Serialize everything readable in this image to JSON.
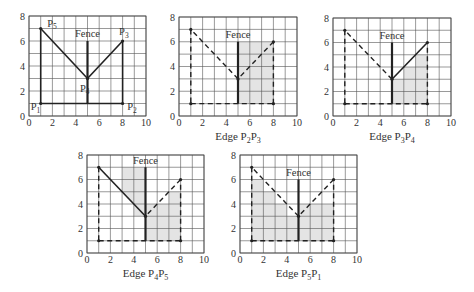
{
  "figure": {
    "fence_label": "Fence",
    "axis": {
      "x_ticks": [
        0,
        2,
        4,
        6,
        8,
        10
      ],
      "y_ticks": [
        0,
        2,
        4,
        6,
        8
      ],
      "xlim": [
        0,
        10
      ],
      "ylim": [
        0,
        8
      ]
    },
    "points": {
      "P1": [
        1,
        1
      ],
      "P2": [
        8,
        1
      ],
      "P3": [
        8,
        6
      ],
      "P4": [
        5,
        3
      ],
      "P5": [
        1,
        7
      ]
    },
    "fence": {
      "x": 5,
      "y_from": 1,
      "y_to": 6
    },
    "colors": {
      "line": "#222222",
      "grid": "#555555",
      "shade": "#e4e4e4"
    }
  },
  "panels": [
    {
      "id": "polygon",
      "caption": "",
      "caption_parts": [],
      "frame": {
        "x": 29,
        "y": 16,
        "w": 117,
        "h": 100
      },
      "show_point_labels": true,
      "point_labels": [
        {
          "name": "P",
          "sub": "1",
          "x": 0.15,
          "y": 0.45
        },
        {
          "name": "P",
          "sub": "2",
          "x": 8.4,
          "y": 0.45
        },
        {
          "name": "P",
          "sub": "3",
          "x": 7.7,
          "y": 6.45
        },
        {
          "name": "P",
          "sub": "4",
          "x": 4.35,
          "y": 1.95
        },
        {
          "name": "P",
          "sub": "5",
          "x": 1.55,
          "y": 7.15
        }
      ],
      "fence_top": 6,
      "fence_label_pos": [
        5,
        6.3
      ],
      "solid_edges": [
        [
          "P1",
          "P2"
        ],
        [
          "P2",
          "P3"
        ],
        [
          "P3",
          "P4"
        ],
        [
          "P4",
          "P5"
        ],
        [
          "P5",
          "P1"
        ]
      ],
      "dashed_edges": [],
      "shade": []
    },
    {
      "id": "edge-p2p3",
      "caption": "Edge P2P3",
      "caption_parts": [
        "Edge P",
        "2",
        "P",
        "3"
      ],
      "frame": {
        "x": 179,
        "y": 17,
        "w": 118,
        "h": 99
      },
      "show_point_labels": false,
      "point_labels": [],
      "fence_top": 6,
      "fence_label_pos": [
        5,
        6.3
      ],
      "solid_edges": [],
      "dashed_edges": [
        [
          "P1",
          "P2"
        ],
        [
          "P2",
          "P3"
        ],
        [
          "P3",
          "P4"
        ],
        [
          "P4",
          "P5"
        ],
        [
          "P5",
          "P1"
        ]
      ],
      "shade": [
        [
          [
            5,
            1
          ],
          [
            8,
            1
          ],
          [
            8,
            6
          ],
          [
            5,
            6
          ]
        ]
      ]
    },
    {
      "id": "edge-p3p4",
      "caption": "Edge P3P4",
      "caption_parts": [
        "Edge P",
        "3",
        "P",
        "4"
      ],
      "frame": {
        "x": 333,
        "y": 18,
        "w": 118,
        "h": 98
      },
      "show_point_labels": false,
      "point_labels": [],
      "fence_top": 6,
      "fence_label_pos": [
        5,
        6.3
      ],
      "solid_edges": [
        [
          "P3",
          "P4"
        ]
      ],
      "dashed_edges": [
        [
          "P1",
          "P2"
        ],
        [
          "P2",
          "P3"
        ],
        [
          "P4",
          "P5"
        ],
        [
          "P5",
          "P1"
        ]
      ],
      "shade": [
        [
          [
            5,
            1
          ],
          [
            8,
            1
          ],
          [
            8,
            5
          ],
          [
            7,
            5
          ],
          [
            7,
            4
          ],
          [
            6,
            4
          ],
          [
            6,
            3
          ],
          [
            5,
            3
          ]
        ]
      ]
    },
    {
      "id": "edge-p4p5",
      "caption": "Edge P4P5",
      "caption_parts": [
        "Edge P",
        "4",
        "P",
        "5"
      ],
      "frame": {
        "x": 87,
        "y": 155,
        "w": 117,
        "h": 98
      },
      "show_point_labels": false,
      "point_labels": [],
      "fence_top": 7,
      "fence_label_pos": [
        5,
        7.3
      ],
      "solid_edges": [
        [
          "P4",
          "P5"
        ]
      ],
      "dashed_edges": [
        [
          "P1",
          "P2"
        ],
        [
          "P2",
          "P3"
        ],
        [
          "P3",
          "P4"
        ],
        [
          "P5",
          "P1"
        ]
      ],
      "shade": [
        [
          [
            3,
            5
          ],
          [
            3,
            7
          ],
          [
            5,
            7
          ],
          [
            5,
            3
          ],
          [
            4,
            3
          ],
          [
            4,
            4
          ]
        ],
        [
          [
            5,
            1
          ],
          [
            8,
            1
          ],
          [
            8,
            5
          ],
          [
            7,
            5
          ],
          [
            7,
            4
          ],
          [
            5,
            4
          ]
        ]
      ]
    },
    {
      "id": "edge-p5p1",
      "caption": "Edge P5P1",
      "caption_parts": [
        "Edge P",
        "5",
        "P",
        "1"
      ],
      "frame": {
        "x": 240,
        "y": 155,
        "w": 117,
        "h": 98
      },
      "show_point_labels": false,
      "point_labels": [],
      "fence_top": 6,
      "fence_label_pos": [
        5,
        6.3
      ],
      "solid_edges": [],
      "dashed_edges": [
        [
          "P1",
          "P2"
        ],
        [
          "P2",
          "P3"
        ],
        [
          "P3",
          "P4"
        ],
        [
          "P4",
          "P5"
        ],
        [
          "P5",
          "P1"
        ]
      ],
      "shade": [
        [
          [
            1,
            1
          ],
          [
            8,
            1
          ],
          [
            8,
            4
          ],
          [
            5,
            4
          ],
          [
            5,
            3
          ],
          [
            4,
            3
          ],
          [
            4,
            4
          ],
          [
            3,
            4
          ],
          [
            3,
            5
          ],
          [
            2,
            5
          ],
          [
            2,
            6
          ],
          [
            1,
            6
          ]
        ]
      ]
    }
  ]
}
